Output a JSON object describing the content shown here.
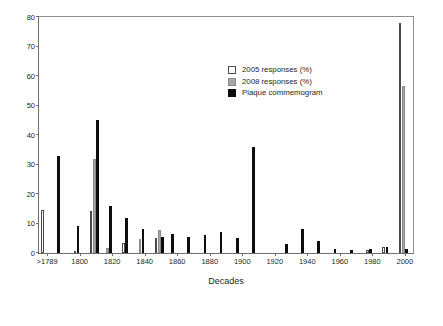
{
  "chart_data": {
    "type": "bar",
    "title": "",
    "xlabel": "Decades",
    "ylabel": "Percentage of responses",
    "ylim": [
      0,
      80
    ],
    "yticks": [
      0,
      10,
      20,
      30,
      40,
      50,
      60,
      70,
      80
    ],
    "xticks": [
      ">1789",
      "1800",
      "1820",
      "1840",
      "1860",
      "1880",
      "1900",
      "1920",
      "1940",
      "1960",
      "1980",
      "2000"
    ],
    "grid": false,
    "legend_position": "upper center-right",
    "categories": [
      ">1789",
      "1790",
      "1800",
      "1810",
      "1820",
      "1830",
      "1840",
      "1850",
      "1860",
      "1870",
      "1880",
      "1890",
      "1900",
      "1910",
      "1920",
      "1930",
      "1940",
      "1950",
      "1960",
      "1970",
      "1980",
      "1990",
      "2000"
    ],
    "series": [
      {
        "name": "2005 responses (%)",
        "color": "#ffffff",
        "values": [
          14.5,
          0,
          0.5,
          14.3,
          0,
          3.3,
          0,
          5.0,
          0,
          0,
          0,
          0,
          0,
          0,
          0,
          0,
          0,
          0,
          0,
          0,
          1.0,
          2.0,
          78.0
        ]
      },
      {
        "name": "2008 responses (%)",
        "color": "#a8a8a8",
        "values": [
          0,
          0,
          0,
          31.8,
          1.6,
          0,
          4.6,
          7.8,
          0,
          0,
          0,
          0,
          0,
          0,
          0,
          0,
          0,
          0,
          0,
          0,
          0,
          0,
          56.5
        ]
      },
      {
        "name": "Plaque commemogram",
        "color": "#0d0d0d",
        "values": [
          0,
          32.8,
          9.0,
          45.0,
          16.0,
          12.0,
          8.0,
          5.5,
          6.5,
          5.5,
          6.0,
          7.0,
          5.0,
          35.8,
          0,
          3.0,
          8.0,
          4.0,
          1.2,
          1.0,
          1.5,
          2.2,
          1.5
        ]
      }
    ]
  },
  "legend": {
    "items": [
      {
        "label": "2005 responses (%)",
        "swatch": "c2005"
      },
      {
        "label": "2008 responses (%)",
        "swatch": "c2008"
      },
      {
        "label": "Plaque commemogram",
        "swatch": "cplq"
      }
    ]
  },
  "axes": {
    "y_title": "Percentage of responses",
    "x_title": "Decades"
  }
}
